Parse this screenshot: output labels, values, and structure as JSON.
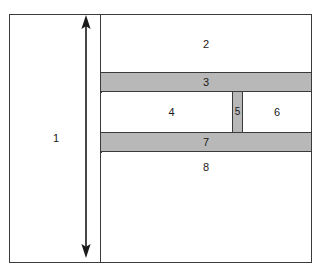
{
  "figure": {
    "type": "schematic-cross-section",
    "background_color": "#ffffff",
    "outline_color": "#3a3a3a",
    "shaded_color": "#b8b8b8",
    "crop_remnant_text": "",
    "regions": [
      {
        "id": "region-1",
        "label": "1",
        "fill": "plain",
        "role": "left-tall-block"
      },
      {
        "id": "region-2",
        "label": "2",
        "fill": "plain",
        "role": "top-layer"
      },
      {
        "id": "region-3",
        "label": "3",
        "fill": "shaded",
        "role": "upper-shaded-band"
      },
      {
        "id": "region-4",
        "label": "4",
        "fill": "plain",
        "role": "core-left"
      },
      {
        "id": "region-5",
        "label": "5",
        "fill": "shaded",
        "role": "vertical-shaded-bar"
      },
      {
        "id": "region-6",
        "label": "6",
        "fill": "plain",
        "role": "core-right"
      },
      {
        "id": "region-7",
        "label": "7",
        "fill": "shaded",
        "role": "lower-shaded-band"
      },
      {
        "id": "region-8",
        "label": "8",
        "fill": "plain",
        "role": "bottom-layer"
      }
    ],
    "dimension_arrow": {
      "name": "height-dimension-arrow",
      "orientation": "vertical",
      "heads": "double",
      "annotation": ""
    }
  }
}
